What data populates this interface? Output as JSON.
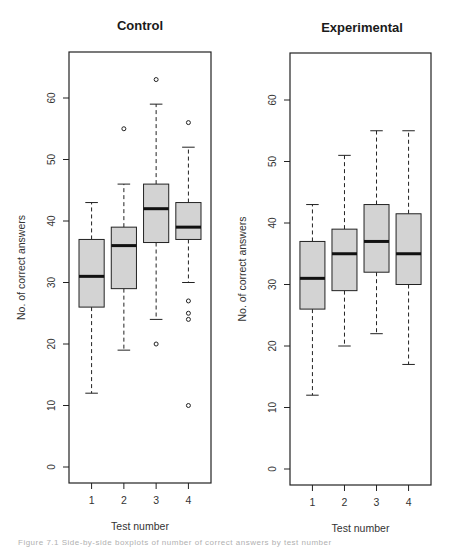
{
  "figure": {
    "caption": "Figure 7.1  Side-by-side boxplots of number of correct answers by test number"
  },
  "style": {
    "box_fill": "#d3d3d3",
    "stroke": "#222222",
    "background": "#ffffff"
  },
  "chart_data": [
    {
      "type": "boxplot",
      "title": "Control",
      "xlabel": "Test number",
      "ylabel": "No. of correct answers",
      "categories": [
        "1",
        "2",
        "3",
        "4"
      ],
      "yticks": [
        0,
        10,
        20,
        30,
        40,
        50,
        60
      ],
      "ylim": [
        -3,
        67
      ],
      "grid": false,
      "boxes": [
        {
          "test": "1",
          "lower_whisker": 12,
          "q1": 26,
          "median": 31,
          "q3": 37,
          "upper_whisker": 43,
          "outliers": []
        },
        {
          "test": "2",
          "lower_whisker": 19,
          "q1": 29,
          "median": 36,
          "q3": 39,
          "upper_whisker": 46,
          "outliers": [
            55
          ]
        },
        {
          "test": "3",
          "lower_whisker": 24,
          "q1": 36.5,
          "median": 42,
          "q3": 46,
          "upper_whisker": 59,
          "outliers": [
            20,
            63
          ]
        },
        {
          "test": "4",
          "lower_whisker": 30,
          "q1": 37,
          "median": 39,
          "q3": 43,
          "upper_whisker": 52,
          "outliers": [
            56,
            27,
            25,
            24,
            10
          ]
        }
      ]
    },
    {
      "type": "boxplot",
      "title": "Experimental",
      "xlabel": "Test number",
      "ylabel": "No. of correct answers",
      "categories": [
        "1",
        "2",
        "3",
        "4"
      ],
      "yticks": [
        0,
        10,
        20,
        30,
        40,
        50,
        60
      ],
      "ylim": [
        -3,
        67
      ],
      "grid": false,
      "boxes": [
        {
          "test": "1",
          "lower_whisker": 12,
          "q1": 26,
          "median": 31,
          "q3": 37,
          "upper_whisker": 43,
          "outliers": []
        },
        {
          "test": "2",
          "lower_whisker": 20,
          "q1": 29,
          "median": 35,
          "q3": 39,
          "upper_whisker": 51,
          "outliers": []
        },
        {
          "test": "3",
          "lower_whisker": 22,
          "q1": 32,
          "median": 37,
          "q3": 43,
          "upper_whisker": 55,
          "outliers": []
        },
        {
          "test": "4",
          "lower_whisker": 17,
          "q1": 30,
          "median": 35,
          "q3": 41.5,
          "upper_whisker": 55,
          "outliers": []
        }
      ]
    }
  ]
}
